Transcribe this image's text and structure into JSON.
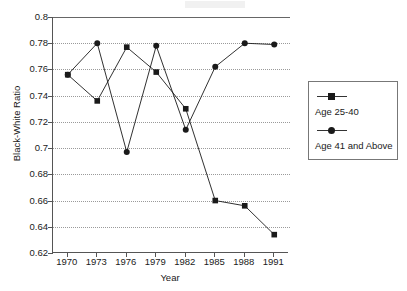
{
  "chart_data": {
    "type": "line",
    "title": "",
    "xlabel": "Year",
    "ylabel": "Black-White Ratio",
    "categories": [
      "1970",
      "1973",
      "1976",
      "1979",
      "1982",
      "1985",
      "1988",
      "1991"
    ],
    "x": [
      1970,
      1973,
      1976,
      1979,
      1982,
      1985,
      1988,
      1991
    ],
    "xlim": [
      1968.5,
      1992.5
    ],
    "ylim": [
      0.62,
      0.8
    ],
    "yticks": [
      0.62,
      0.64,
      0.66,
      0.68,
      0.7,
      0.72,
      0.74,
      0.76,
      0.78,
      0.8
    ],
    "ytick_labels": [
      "0.62",
      "0.64",
      "0.66",
      "0.68",
      "0.7",
      "0.72",
      "0.74",
      "0.76",
      "0.78",
      "0.8"
    ],
    "grid": "horizontal-dotted",
    "legend_position": "right-outside",
    "series": [
      {
        "name": "Age 25-40",
        "marker": "square",
        "color": "#1a1a1a",
        "values": [
          0.756,
          0.736,
          0.777,
          0.758,
          0.73,
          0.66,
          0.656,
          0.634
        ]
      },
      {
        "name": "Age 41 and Above",
        "marker": "circle",
        "color": "#1a1a1a",
        "values": [
          0.756,
          0.78,
          0.697,
          0.778,
          0.714,
          0.762,
          0.78,
          0.779
        ]
      }
    ]
  },
  "legend": {
    "entries": [
      {
        "label": "Age 25-40",
        "marker": "square"
      },
      {
        "label": "Age 41 and Above",
        "marker": "circle"
      }
    ]
  },
  "colors": {
    "ink": "#1a1a1a",
    "axis": "#555555",
    "grid": "#9a9a9a",
    "background": "#ffffff"
  }
}
